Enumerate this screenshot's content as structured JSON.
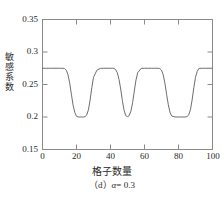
{
  "chart_data": {
    "type": "line",
    "title": "",
    "subtitle": "",
    "xlabel": "格子数量",
    "ylabel": "敏感系数",
    "caption": "（d）α = 0.3",
    "caption_prefix": "（d）",
    "caption_alpha": "α",
    "caption_value": "= 0.3",
    "xlim": [
      0,
      100
    ],
    "ylim": [
      0.15,
      0.35
    ],
    "xticks": [
      0,
      20,
      40,
      60,
      80,
      100
    ],
    "xtick_labels": [
      "0",
      "20",
      "40",
      "60",
      "80",
      "100"
    ],
    "yticks": [
      0.15,
      0.2,
      0.25,
      0.3,
      0.35
    ],
    "ytick_labels": [
      "0.15",
      "0.2",
      "0.25",
      "0.3",
      "0.35"
    ],
    "grid": false,
    "legend": null,
    "line_color": "#6e6e6e",
    "plateau_value": 0.275,
    "trough_value": 0.2,
    "series": [
      {
        "name": "敏感系数",
        "x": [
          0,
          2,
          4,
          6,
          8,
          10,
          12,
          13,
          14,
          15,
          16,
          17,
          18,
          19,
          20,
          21,
          22,
          23,
          24,
          25,
          26,
          27,
          28,
          29,
          30,
          32,
          34,
          36,
          38,
          40,
          41,
          42,
          43,
          44,
          45,
          46,
          47,
          48,
          49,
          50,
          51,
          52,
          53,
          54,
          55,
          56,
          58,
          60,
          62,
          64,
          66,
          68,
          69,
          70,
          71,
          72,
          73,
          74,
          75,
          76,
          78,
          80,
          82,
          84,
          85,
          86,
          87,
          88,
          89,
          90,
          91,
          92,
          94,
          96,
          98,
          100
        ],
        "y": [
          0.275,
          0.275,
          0.275,
          0.275,
          0.275,
          0.275,
          0.275,
          0.2745,
          0.272,
          0.265,
          0.252,
          0.235,
          0.218,
          0.207,
          0.201,
          0.2,
          0.2,
          0.2,
          0.2,
          0.2005,
          0.203,
          0.211,
          0.226,
          0.245,
          0.261,
          0.272,
          0.2748,
          0.275,
          0.275,
          0.275,
          0.275,
          0.2748,
          0.273,
          0.268,
          0.258,
          0.243,
          0.225,
          0.21,
          0.202,
          0.2005,
          0.202,
          0.209,
          0.222,
          0.24,
          0.257,
          0.268,
          0.2748,
          0.275,
          0.275,
          0.275,
          0.275,
          0.275,
          0.2745,
          0.272,
          0.265,
          0.252,
          0.235,
          0.219,
          0.207,
          0.2015,
          0.2,
          0.2,
          0.2,
          0.2,
          0.2005,
          0.203,
          0.211,
          0.226,
          0.245,
          0.261,
          0.27,
          0.2748,
          0.275,
          0.275,
          0.275,
          0.275
        ]
      }
    ],
    "troughs": [
      {
        "center": 20,
        "start": 13,
        "end": 28,
        "value": 0.2
      },
      {
        "center": 48,
        "start": 42,
        "end": 55,
        "value": 0.2
      },
      {
        "center": 80,
        "start": 70,
        "end": 90,
        "value": 0.2
      }
    ],
    "plateaus": [
      {
        "start": 0,
        "end": 13,
        "value": 0.275
      },
      {
        "start": 28,
        "end": 42,
        "value": 0.275
      },
      {
        "start": 55,
        "end": 70,
        "value": 0.275
      },
      {
        "start": 90,
        "end": 100,
        "value": 0.275
      }
    ]
  },
  "axes": {
    "frame_color": "#8a8a8a",
    "tick_color": "#8a8a8a"
  }
}
